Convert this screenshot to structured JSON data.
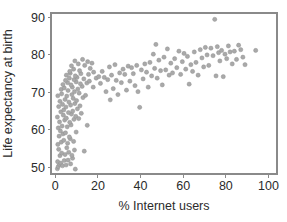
{
  "chart_data": {
    "type": "scatter",
    "title": "",
    "xlabel": "% Internet users",
    "ylabel": "Life expectancy at birth",
    "xlim": [
      -2,
      104
    ],
    "ylim": [
      48.2,
      91.2
    ],
    "xticks": [
      0,
      20,
      40,
      60,
      80,
      100
    ],
    "yticks": [
      50,
      60,
      70,
      80,
      90
    ],
    "xtick_labels": [
      "0",
      "20",
      "40",
      "60",
      "80",
      "100"
    ],
    "ytick_labels": [
      "50",
      "60",
      "70",
      "80",
      "90"
    ],
    "grid": false,
    "legend": null,
    "marker": {
      "shape": "circle",
      "size_px": 2.1,
      "color": "#a9a9a9",
      "edge_color": "#8f8f8f"
    },
    "frame": {
      "visible": true,
      "color": "#8a8a8a"
    },
    "n_points": 186,
    "points": [
      [
        1.0,
        49.6
      ],
      [
        1.4,
        50.2
      ],
      [
        2.0,
        50.8
      ],
      [
        1.1,
        51.5
      ],
      [
        2.6,
        51.1
      ],
      [
        3.4,
        50.4
      ],
      [
        4.2,
        51.8
      ],
      [
        5.1,
        50.6
      ],
      [
        6.0,
        51.9
      ],
      [
        7.2,
        50.9
      ],
      [
        8.1,
        52.4
      ],
      [
        9.4,
        49.5
      ],
      [
        2.2,
        53.1
      ],
      [
        3.0,
        53.8
      ],
      [
        4.6,
        53.4
      ],
      [
        6.3,
        54.0
      ],
      [
        7.8,
        53.2
      ],
      [
        1.6,
        54.8
      ],
      [
        5.4,
        55.2
      ],
      [
        9.0,
        54.6
      ],
      [
        13.6,
        54.3
      ],
      [
        1.2,
        56.1
      ],
      [
        2.8,
        56.7
      ],
      [
        4.0,
        57.2
      ],
      [
        5.8,
        56.4
      ],
      [
        7.0,
        57.6
      ],
      [
        8.6,
        56.9
      ],
      [
        1.8,
        58.3
      ],
      [
        3.6,
        58.9
      ],
      [
        6.6,
        58.1
      ],
      [
        2.4,
        59.7
      ],
      [
        4.8,
        59.2
      ],
      [
        9.8,
        59.4
      ],
      [
        1.4,
        60.5
      ],
      [
        3.2,
        61.0
      ],
      [
        5.6,
        60.8
      ],
      [
        7.4,
        61.3
      ],
      [
        15.0,
        61.2
      ],
      [
        2.0,
        62.1
      ],
      [
        4.4,
        62.6
      ],
      [
        6.8,
        62.0
      ],
      [
        8.8,
        62.8
      ],
      [
        1.0,
        63.4
      ],
      [
        3.8,
        63.9
      ],
      [
        5.2,
        63.1
      ],
      [
        7.6,
        64.2
      ],
      [
        9.6,
        63.6
      ],
      [
        11.0,
        63.0
      ],
      [
        2.6,
        64.8
      ],
      [
        4.0,
        65.3
      ],
      [
        6.2,
        64.6
      ],
      [
        8.2,
        65.0
      ],
      [
        10.4,
        65.6
      ],
      [
        12.2,
        64.4
      ],
      [
        1.6,
        66.2
      ],
      [
        3.4,
        66.8
      ],
      [
        5.0,
        66.1
      ],
      [
        7.2,
        66.6
      ],
      [
        9.2,
        67.0
      ],
      [
        11.6,
        66.4
      ],
      [
        2.2,
        67.6
      ],
      [
        4.6,
        68.1
      ],
      [
        6.4,
        67.4
      ],
      [
        8.4,
        68.4
      ],
      [
        10.0,
        67.8
      ],
      [
        13.0,
        68.6
      ],
      [
        1.2,
        69.1
      ],
      [
        3.0,
        69.6
      ],
      [
        5.4,
        69.0
      ],
      [
        7.8,
        69.4
      ],
      [
        9.0,
        70.2
      ],
      [
        11.2,
        69.8
      ],
      [
        14.2,
        69.2
      ],
      [
        2.8,
        70.8
      ],
      [
        4.2,
        71.2
      ],
      [
        6.0,
        70.5
      ],
      [
        8.0,
        71.4
      ],
      [
        10.6,
        70.9
      ],
      [
        12.6,
        71.6
      ],
      [
        3.6,
        72.1
      ],
      [
        5.8,
        72.6
      ],
      [
        7.4,
        72.0
      ],
      [
        9.8,
        72.8
      ],
      [
        11.8,
        72.3
      ],
      [
        14.8,
        72.5
      ],
      [
        4.8,
        73.2
      ],
      [
        6.6,
        73.8
      ],
      [
        8.8,
        73.4
      ],
      [
        10.2,
        74.0
      ],
      [
        13.4,
        73.6
      ],
      [
        5.2,
        74.6
      ],
      [
        7.0,
        75.1
      ],
      [
        9.4,
        74.4
      ],
      [
        12.0,
        75.0
      ],
      [
        15.6,
        74.8
      ],
      [
        6.8,
        75.6
      ],
      [
        8.6,
        76.2
      ],
      [
        11.4,
        75.8
      ],
      [
        16.4,
        76.4
      ],
      [
        7.6,
        77.1
      ],
      [
        10.8,
        77.6
      ],
      [
        13.8,
        77.2
      ],
      [
        17.2,
        77.8
      ],
      [
        9.2,
        78.4
      ],
      [
        12.8,
        78.8
      ],
      [
        15.2,
        78.2
      ],
      [
        18.0,
        75.4
      ],
      [
        16.0,
        73.0
      ],
      [
        17.8,
        71.4
      ],
      [
        19.2,
        73.8
      ],
      [
        20.4,
        74.2
      ],
      [
        21.2,
        72.4
      ],
      [
        22.0,
        75.6
      ],
      [
        23.0,
        74.0
      ],
      [
        23.8,
        70.2
      ],
      [
        24.6,
        73.4
      ],
      [
        25.4,
        76.8
      ],
      [
        25.8,
        68.0
      ],
      [
        26.4,
        74.6
      ],
      [
        27.2,
        71.0
      ],
      [
        28.0,
        77.4
      ],
      [
        28.6,
        73.2
      ],
      [
        29.4,
        69.4
      ],
      [
        30.2,
        75.2
      ],
      [
        31.0,
        72.6
      ],
      [
        31.8,
        76.2
      ],
      [
        32.6,
        74.8
      ],
      [
        33.4,
        70.6
      ],
      [
        34.2,
        77.0
      ],
      [
        35.0,
        73.0
      ],
      [
        35.8,
        76.6
      ],
      [
        36.6,
        75.0
      ],
      [
        37.4,
        71.8
      ],
      [
        38.2,
        77.2
      ],
      [
        38.8,
        70.2
      ],
      [
        39.6,
        66.0
      ],
      [
        40.4,
        76.0
      ],
      [
        41.2,
        73.6
      ],
      [
        42.0,
        77.6
      ],
      [
        42.8,
        75.4
      ],
      [
        43.6,
        71.4
      ],
      [
        44.4,
        78.0
      ],
      [
        45.2,
        74.4
      ],
      [
        46.0,
        80.2
      ],
      [
        46.6,
        76.4
      ],
      [
        47.2,
        82.8
      ],
      [
        47.8,
        73.8
      ],
      [
        48.6,
        78.6
      ],
      [
        49.4,
        75.8
      ],
      [
        50.2,
        72.0
      ],
      [
        51.0,
        79.4
      ],
      [
        51.8,
        76.0
      ],
      [
        52.6,
        81.6
      ],
      [
        53.4,
        74.6
      ],
      [
        54.2,
        77.8
      ],
      [
        55.0,
        75.2
      ],
      [
        56.0,
        79.0
      ],
      [
        57.0,
        76.6
      ],
      [
        58.0,
        81.0
      ],
      [
        58.8,
        74.8
      ],
      [
        59.6,
        78.2
      ],
      [
        60.4,
        80.4
      ],
      [
        61.2,
        76.2
      ],
      [
        62.0,
        79.6
      ],
      [
        62.8,
        72.2
      ],
      [
        63.6,
        77.4
      ],
      [
        64.4,
        75.6
      ],
      [
        65.2,
        80.8
      ],
      [
        66.0,
        78.0
      ],
      [
        67.0,
        74.6
      ],
      [
        68.0,
        81.4
      ],
      [
        68.8,
        79.2
      ],
      [
        69.6,
        76.8
      ],
      [
        70.4,
        82.0
      ],
      [
        71.2,
        80.0
      ],
      [
        72.0,
        77.2
      ],
      [
        73.0,
        81.8
      ],
      [
        74.0,
        79.8
      ],
      [
        74.8,
        89.5
      ],
      [
        75.4,
        74.4
      ],
      [
        76.0,
        82.2
      ],
      [
        76.6,
        80.6
      ],
      [
        77.2,
        78.4
      ],
      [
        78.0,
        81.2
      ],
      [
        78.8,
        74.2
      ],
      [
        79.6,
        80.2
      ],
      [
        80.4,
        79.0
      ],
      [
        81.2,
        82.4
      ],
      [
        82.0,
        80.8
      ],
      [
        83.0,
        77.6
      ],
      [
        84.0,
        81.0
      ],
      [
        85.0,
        78.8
      ],
      [
        86.0,
        82.6
      ],
      [
        87.0,
        81.4
      ],
      [
        88.0,
        79.4
      ],
      [
        89.0,
        77.4
      ],
      [
        94.0,
        81.2
      ]
    ]
  },
  "geometry": {
    "width": 287,
    "height": 222,
    "plot_left": 51,
    "plot_right": 277,
    "plot_top": 13,
    "plot_bottom": 174,
    "x_axis_title_y": 210,
    "y_axis_title_x": 12
  }
}
